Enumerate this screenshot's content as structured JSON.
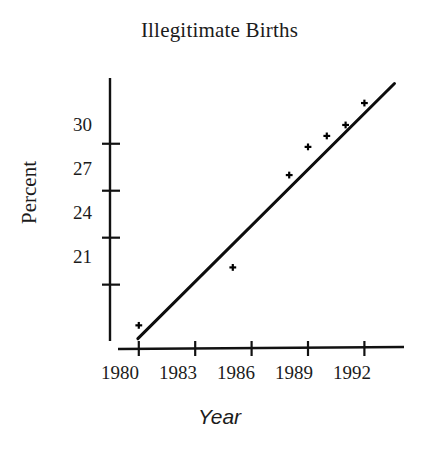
{
  "chart_data": {
    "type": "scatter",
    "title": "Illegitimate Births",
    "xlabel": "Year",
    "ylabel": "Percent",
    "grid": false,
    "legend": null,
    "xlim": [
      1979.0,
      1994.0
    ],
    "ylim": [
      17.4,
      34.2
    ],
    "xticks": [
      1980,
      1983,
      1986,
      1989,
      1992
    ],
    "xtick_labels": [
      "1980",
      "1983",
      "1986",
      "1989",
      "1992"
    ],
    "yticks": [
      21,
      24,
      27,
      30
    ],
    "ytick_labels": [
      "21",
      "24",
      "27",
      "30"
    ],
    "x": [
      1980,
      1985,
      1988,
      1989,
      1990,
      1991,
      1992
    ],
    "y": [
      18.4,
      22.1,
      28.0,
      29.8,
      30.5,
      31.2,
      32.6
    ],
    "points": [
      {
        "x": 1980,
        "y": 18.4
      },
      {
        "x": 1985,
        "y": 22.1
      },
      {
        "x": 1988,
        "y": 28.0
      },
      {
        "x": 1989,
        "y": 29.8
      },
      {
        "x": 1990,
        "y": 30.5
      },
      {
        "x": 1991,
        "y": 31.2
      },
      {
        "x": 1992,
        "y": 32.6
      }
    ],
    "trendline": {
      "type": "linear-fit",
      "x_start": 1979.95,
      "y_start": 17.55,
      "x_end": 1993.6,
      "y_end": 33.85
    },
    "marker": "plus",
    "series_color": "#000000",
    "axis_color": "#000000",
    "background": "#ffffff"
  },
  "axes": {
    "y_axis_label": "Percent",
    "x_axis_label": "Year"
  }
}
